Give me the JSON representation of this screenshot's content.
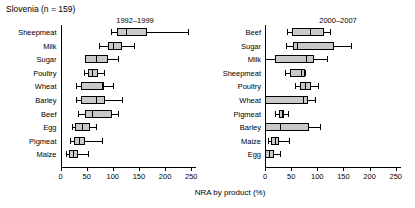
{
  "figure": {
    "title": "Slovenia (n = 159)",
    "xlabel": "NRA by product (%)"
  },
  "chart_data": {
    "type": "box",
    "title": "Slovenia (n = 159)",
    "xlabel": "NRA by product (%)",
    "ylabel": "",
    "xlim": [
      0,
      260
    ],
    "xticks": [
      0,
      50,
      100,
      150,
      200,
      250
    ],
    "grid": false,
    "orientation": "horizontal",
    "box_fill": "#c9c9c9",
    "panels": [
      {
        "name": "1992-1999",
        "label": "1992–1999",
        "categories": [
          "Sheepmeat",
          "Milk",
          "Sugar",
          "Poultry",
          "Wheat",
          "Barley",
          "Beef",
          "Egg",
          "Pigmeat",
          "Maize"
        ],
        "boxes": [
          {
            "category": "Sheepmeat",
            "whisker_low": 97,
            "q1": 108,
            "median": 126,
            "q3": 166,
            "whisker_high": 244
          },
          {
            "category": "Milk",
            "whisker_low": 73,
            "q1": 90,
            "median": 100,
            "q3": 117,
            "whisker_high": 140
          },
          {
            "category": "Sugar",
            "whisker_low": 47,
            "q1": 47,
            "median": 67,
            "q3": 91,
            "whisker_high": 110
          },
          {
            "category": "Poultry",
            "whisker_low": 45,
            "q1": 53,
            "median": 61,
            "q3": 72,
            "whisker_high": 84
          },
          {
            "category": "Wheat",
            "whisker_low": 30,
            "q1": 39,
            "median": 79,
            "q3": 84,
            "whisker_high": 101
          },
          {
            "category": "Barley",
            "whisker_low": 29,
            "q1": 39,
            "median": 67,
            "q3": 86,
            "whisker_high": 117
          },
          {
            "category": "Beef",
            "whisker_low": 33,
            "q1": 46,
            "median": 61,
            "q3": 98,
            "whisker_high": 110
          },
          {
            "category": "Egg",
            "whisker_low": 22,
            "q1": 27,
            "median": 41,
            "q3": 56,
            "whisker_high": 68
          },
          {
            "category": "Pigmeat",
            "whisker_low": 19,
            "q1": 25,
            "median": 36,
            "q3": 46,
            "whisker_high": 79
          },
          {
            "category": "Maize",
            "whisker_low": 11,
            "q1": 17,
            "median": 24,
            "q3": 34,
            "whisker_high": 52
          }
        ]
      },
      {
        "name": "2000-2007",
        "label": "2000–2007",
        "categories": [
          "Beef",
          "Sugar",
          "Milk",
          "Sheepmeat",
          "Poultry",
          "Wheat",
          "Pigmeat",
          "Barley",
          "Maize",
          "Egg"
        ],
        "boxes": [
          {
            "category": "Beef",
            "whisker_low": 42,
            "q1": 52,
            "median": 86,
            "q3": 113,
            "whisker_high": 124
          },
          {
            "category": "Sugar",
            "whisker_low": 40,
            "q1": 54,
            "median": 62,
            "q3": 131,
            "whisker_high": 164
          },
          {
            "category": "Milk",
            "whisker_low": 0,
            "q1": 20,
            "median": 78,
            "q3": 94,
            "whisker_high": 118
          },
          {
            "category": "Sheepmeat",
            "whisker_low": 38,
            "q1": 47,
            "median": 69,
            "q3": 76,
            "whisker_high": 76
          },
          {
            "category": "Poultry",
            "whisker_low": 58,
            "q1": 66,
            "median": 77,
            "q3": 88,
            "whisker_high": 101
          },
          {
            "category": "Wheat",
            "whisker_low": 0,
            "q1": 0,
            "median": 73,
            "q3": 82,
            "whisker_high": 95
          },
          {
            "category": "Pigmeat",
            "whisker_low": 20,
            "q1": 26,
            "median": 32,
            "q3": 37,
            "whisker_high": 44
          },
          {
            "category": "Barley",
            "whisker_low": 0,
            "q1": 0,
            "median": 29,
            "q3": 84,
            "whisker_high": 105
          },
          {
            "category": "Maize",
            "whisker_low": 5,
            "q1": 12,
            "median": 19,
            "q3": 26,
            "whisker_high": 45
          },
          {
            "category": "Egg",
            "whisker_low": 0,
            "q1": 0,
            "median": 8,
            "q3": 17,
            "whisker_high": 28
          }
        ]
      }
    ]
  }
}
